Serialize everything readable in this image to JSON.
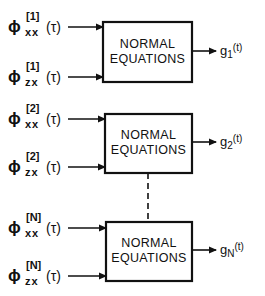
{
  "diagram": {
    "stages": [
      {
        "index": "1",
        "block_label_line1": "NORMAL",
        "block_label_line2": "EQUATIONS",
        "input_xx": {
          "symbol": "ϕ",
          "subscript": "xx",
          "superscript": "[1]",
          "argument": "(τ)"
        },
        "input_zx": {
          "symbol": "ϕ",
          "subscript": "zx",
          "superscript": "[1]",
          "argument": "(τ)"
        },
        "output": {
          "symbol": "g",
          "subscript": "1",
          "argument": "(t)"
        }
      },
      {
        "index": "2",
        "block_label_line1": "NORMAL",
        "block_label_line2": "EQUATIONS",
        "input_xx": {
          "symbol": "ϕ",
          "subscript": "xx",
          "superscript": "[2]",
          "argument": "(τ)"
        },
        "input_zx": {
          "symbol": "ϕ",
          "subscript": "zx",
          "superscript": "[2]",
          "argument": "(τ)"
        },
        "output": {
          "symbol": "g",
          "subscript": "2",
          "argument": "(t)"
        }
      },
      {
        "index": "N",
        "block_label_line1": "NORMAL",
        "block_label_line2": "EQUATIONS",
        "input_xx": {
          "symbol": "ϕ",
          "subscript": "xx",
          "superscript": "[N]",
          "argument": "(τ)"
        },
        "input_zx": {
          "symbol": "ϕ",
          "subscript": "zx",
          "superscript": "[N]",
          "argument": "(τ)"
        },
        "output": {
          "symbol": "g",
          "subscript": "N",
          "argument": "(t)"
        }
      }
    ],
    "continuation": "dashed connector between stage 2 and stage N"
  }
}
